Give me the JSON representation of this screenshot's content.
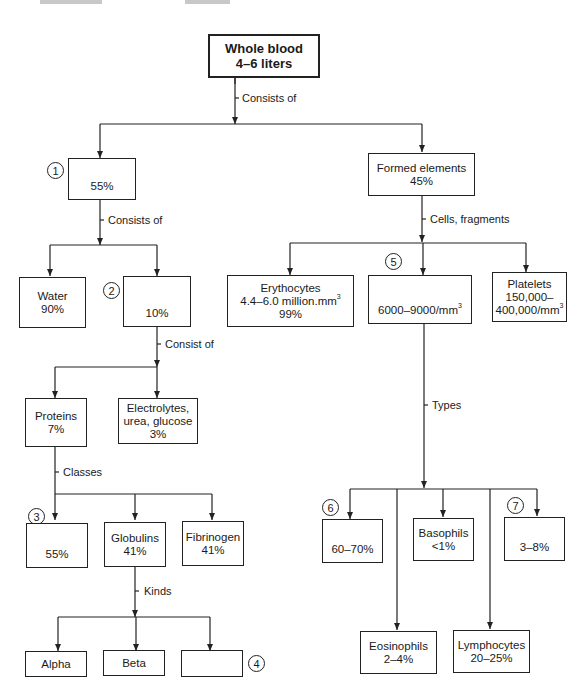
{
  "diagram": {
    "root": {
      "line1": "Whole blood",
      "line2": "4–6 liters"
    },
    "edge_labels": {
      "root_to_children": "Consists of",
      "plasma_to_children": "Consists of",
      "solutes_to_children": "Consist of",
      "proteins_to_children": "Classes",
      "globulins_to_children": "Kinds",
      "formed_to_children": "Cells, fragments",
      "wbc_to_children": "Types"
    },
    "blanks": {
      "1": {
        "marker": "1",
        "value": "55%"
      },
      "2": {
        "marker": "2",
        "value": "10%"
      },
      "3": {
        "marker": "3",
        "value": "55%"
      },
      "4": {
        "marker": "4",
        "value": ""
      },
      "5": {
        "marker": "5",
        "value": "6000–9000/mm",
        "sup": "3"
      },
      "6": {
        "marker": "6",
        "value": "60–70%"
      },
      "7": {
        "marker": "7",
        "value": "3–8%"
      }
    },
    "nodes": {
      "water": {
        "line1": "Water",
        "line2": "90%"
      },
      "proteins": {
        "line1": "Proteins",
        "line2": "7%"
      },
      "electrolytes": {
        "line1": "Electrolytes,",
        "line2": "urea, glucose",
        "line3": "3%"
      },
      "globulins": {
        "line1": "Globulins",
        "line2": "41%"
      },
      "fibrinogen": {
        "line1": "Fibrinogen",
        "line2": "41%"
      },
      "alpha": {
        "line1": "Alpha"
      },
      "beta": {
        "line1": "Beta"
      },
      "formed": {
        "line1": "Formed elements",
        "line2": "45%"
      },
      "erythrocytes": {
        "line1": "Erythocytes",
        "line2": "4.4–6.0 million.mm",
        "line2_sup": "3",
        "line3": "99%"
      },
      "platelets": {
        "line1": "Platelets",
        "line2": "150,000–",
        "line3": "400,000/mm",
        "line3_sup": "3"
      },
      "basophils": {
        "line1": "Basophils",
        "line2": "<1%"
      },
      "eosinophils": {
        "line1": "Eosinophils",
        "line2": "2–4%"
      },
      "lymphocytes": {
        "line1": "Lymphocytes",
        "line2": "20–25%"
      }
    }
  }
}
